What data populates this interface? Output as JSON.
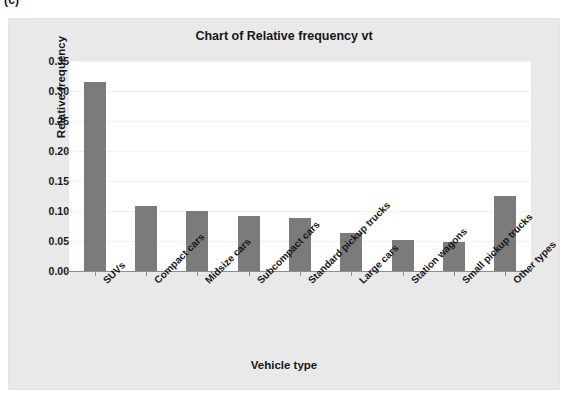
{
  "figure_label": "(c)",
  "chart_data": {
    "type": "bar",
    "title": "Chart of Relative frequency vt",
    "xlabel": "Vehicle type",
    "ylabel": "Relative frequency",
    "categories": [
      "SUVs",
      "Compact cars",
      "Midsize cars",
      "Subcompact cars",
      "Standard pickup trucks",
      "Large cars",
      "Station wagons",
      "Small pickup trucks",
      "Other types"
    ],
    "values": [
      0.315,
      0.108,
      0.1,
      0.092,
      0.088,
      0.063,
      0.051,
      0.049,
      0.125
    ],
    "ylim": [
      0.0,
      0.35
    ],
    "ytick_labels": [
      "0.00",
      "0.05",
      "0.10",
      "0.15",
      "0.20",
      "0.25",
      "0.30",
      "0.35"
    ],
    "ytick_values": [
      0.0,
      0.05,
      0.1,
      0.15,
      0.2,
      0.25,
      0.3,
      0.35
    ],
    "grid": true,
    "legend": "none",
    "bar_color": "#7b7b7b",
    "plot_background": "#ffffff",
    "panel_background": "#e9e9e9",
    "axis_color": "#8d8d8d",
    "text_color": "#17171b"
  }
}
